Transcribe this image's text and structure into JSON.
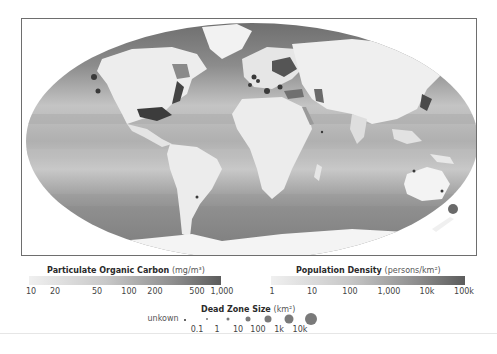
{
  "map": {
    "projection": "robinson-like world map",
    "description": "Global particulate organic carbon (ocean), population density (land), and coastal dead zones"
  },
  "legend_poc": {
    "title": "Particulate Organic Carbon",
    "unit": "(mg/m³)",
    "ticks": [
      "10",
      "20",
      "50",
      "100",
      "200",
      "500",
      "1,000"
    ],
    "color_start": "#eeeeee",
    "color_end": "#5a5a5a"
  },
  "legend_pop": {
    "title": "Population Density",
    "unit": "(persons/km²)",
    "ticks": [
      "1",
      "10",
      "100",
      "1,000",
      "10k",
      "100k"
    ],
    "color_start": "#eeeeee",
    "color_end": "#5a5a5a"
  },
  "legend_dead_zone": {
    "title": "Dead Zone Size",
    "unit": "(km²)",
    "unknown_label": "unkown",
    "ticks": [
      "0.1",
      "1",
      "10",
      "100",
      "1k",
      "10k"
    ],
    "dot_color": "#7a7a7a"
  }
}
